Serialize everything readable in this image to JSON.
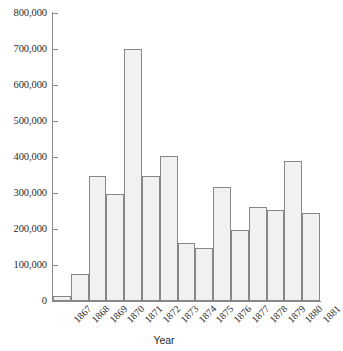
{
  "chart_data": {
    "type": "bar",
    "title": "",
    "xlabel": "Year",
    "ylabel": "",
    "categories": [
      "1867",
      "1868",
      "1869",
      "1870",
      "1871",
      "1872",
      "1873",
      "1874",
      "1875",
      "1876",
      "1877",
      "1878",
      "1879",
      "1880",
      "1881"
    ],
    "values": [
      15000,
      75000,
      348000,
      298000,
      700000,
      348000,
      402000,
      162000,
      148000,
      318000,
      197000,
      260000,
      253000,
      390000,
      244000
    ],
    "ylim": [
      0,
      800000
    ],
    "ytick_values": [
      0,
      100000,
      200000,
      300000,
      400000,
      500000,
      600000,
      700000,
      800000
    ],
    "ytick_labels": [
      "0",
      "100,000",
      "200,000",
      "300,000",
      "400,000",
      "500,000",
      "600,000",
      "700,000",
      "800,000"
    ],
    "grid": false,
    "legend": null,
    "bar_fill_color": "#f1f1f1",
    "bar_border_color": "#878787",
    "axis_color": "#8a8a8a",
    "text_color": "#2b2b2b"
  }
}
